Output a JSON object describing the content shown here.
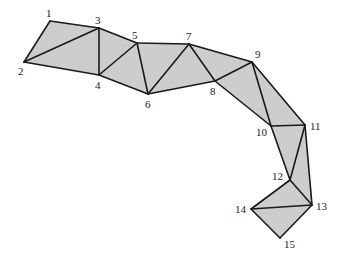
{
  "diagram": {
    "type": "triangulated-polygon",
    "fill_color": "#cdcdcd",
    "edge_color": "#1a1a1a",
    "vertices": [
      {
        "id": "1",
        "label": "1",
        "x": 50,
        "y": 21,
        "lx": 46,
        "ly": 17
      },
      {
        "id": "2",
        "label": "2",
        "x": 24,
        "y": 62,
        "lx": 18,
        "ly": 75
      },
      {
        "id": "3",
        "label": "3",
        "x": 99,
        "y": 28,
        "lx": 95,
        "ly": 24
      },
      {
        "id": "4",
        "label": "4",
        "x": 99,
        "y": 75,
        "lx": 95,
        "ly": 89
      },
      {
        "id": "5",
        "label": "5",
        "x": 137,
        "y": 43,
        "lx": 132,
        "ly": 39
      },
      {
        "id": "6",
        "label": "6",
        "x": 148,
        "y": 94,
        "lx": 145,
        "ly": 108
      },
      {
        "id": "7",
        "label": "7",
        "x": 189,
        "y": 44,
        "lx": 186,
        "ly": 40
      },
      {
        "id": "8",
        "label": "8",
        "x": 215,
        "y": 81,
        "lx": 210,
        "ly": 95
      },
      {
        "id": "9",
        "label": "9",
        "x": 252,
        "y": 62,
        "lx": 255,
        "ly": 58
      },
      {
        "id": "10",
        "label": "10",
        "x": 271,
        "y": 126,
        "lx": 256,
        "ly": 136
      },
      {
        "id": "11",
        "label": "11",
        "x": 305,
        "y": 125,
        "lx": 310,
        "ly": 130
      },
      {
        "id": "12",
        "label": "12",
        "x": 290,
        "y": 180,
        "lx": 272,
        "ly": 180
      },
      {
        "id": "13",
        "label": "13",
        "x": 312,
        "y": 205,
        "lx": 316,
        "ly": 210
      },
      {
        "id": "14",
        "label": "14",
        "x": 251,
        "y": 209,
        "lx": 235,
        "ly": 213
      },
      {
        "id": "15",
        "label": "15",
        "x": 280,
        "y": 238,
        "lx": 284,
        "ly": 248
      }
    ],
    "triangles": [
      [
        "1",
        "2",
        "3"
      ],
      [
        "2",
        "3",
        "4"
      ],
      [
        "3",
        "4",
        "5"
      ],
      [
        "4",
        "5",
        "6"
      ],
      [
        "5",
        "6",
        "7"
      ],
      [
        "6",
        "7",
        "8"
      ],
      [
        "7",
        "8",
        "9"
      ],
      [
        "8",
        "9",
        "10"
      ],
      [
        "9",
        "10",
        "11"
      ],
      [
        "10",
        "11",
        "12"
      ],
      [
        "11",
        "12",
        "13"
      ],
      [
        "12",
        "13",
        "14"
      ],
      [
        "13",
        "14",
        "15"
      ]
    ],
    "edges": [
      [
        "1",
        "2"
      ],
      [
        "1",
        "3"
      ],
      [
        "2",
        "3"
      ],
      [
        "2",
        "4"
      ],
      [
        "3",
        "4"
      ],
      [
        "3",
        "5"
      ],
      [
        "4",
        "5"
      ],
      [
        "4",
        "6"
      ],
      [
        "5",
        "6"
      ],
      [
        "5",
        "7"
      ],
      [
        "6",
        "7"
      ],
      [
        "6",
        "8"
      ],
      [
        "7",
        "8"
      ],
      [
        "7",
        "9"
      ],
      [
        "8",
        "9"
      ],
      [
        "8",
        "10"
      ],
      [
        "9",
        "10"
      ],
      [
        "9",
        "11"
      ],
      [
        "10",
        "11"
      ],
      [
        "10",
        "12"
      ],
      [
        "11",
        "12"
      ],
      [
        "11",
        "13"
      ],
      [
        "12",
        "13"
      ],
      [
        "12",
        "14"
      ],
      [
        "13",
        "14"
      ],
      [
        "13",
        "15"
      ],
      [
        "14",
        "15"
      ]
    ]
  }
}
